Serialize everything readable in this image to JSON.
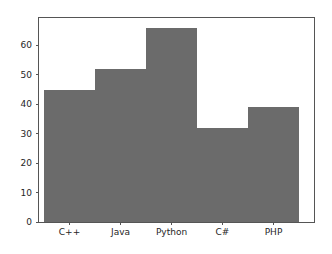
{
  "figure": {
    "background_color": "#ffffff",
    "spine_color": "#555555",
    "tick_label_color": "#262626"
  },
  "chart_data": {
    "type": "bar",
    "categories": [
      "C++",
      "Java",
      "Python",
      "C#",
      "PHP"
    ],
    "values": [
      45,
      52,
      66,
      32,
      39
    ],
    "title": "",
    "xlabel": "",
    "ylabel": "",
    "ylim": [
      0,
      69.3
    ],
    "yticks": [
      0,
      10,
      20,
      30,
      40,
      50,
      60
    ],
    "xtick_labels": [
      "C++",
      "Java",
      "Python",
      "C#",
      "PHP"
    ],
    "bar_color": "#6b6b6b",
    "bar_gap": 0,
    "grid": false,
    "legend": false
  }
}
